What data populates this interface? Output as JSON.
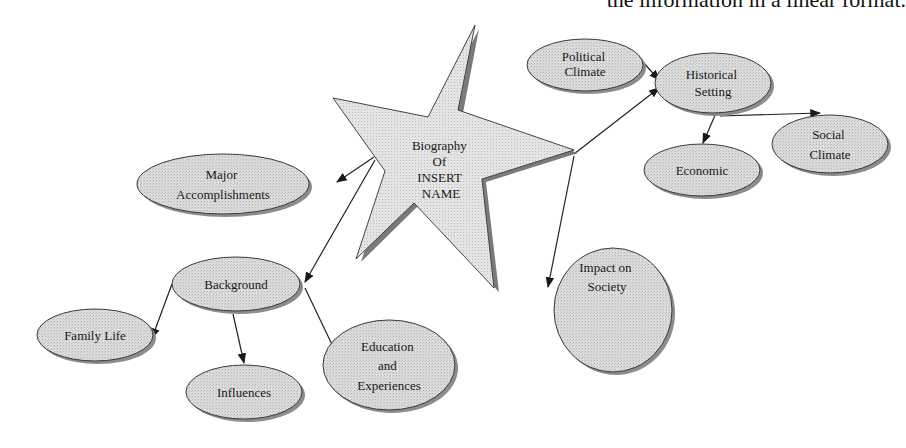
{
  "caption": "the information in a linear format.",
  "diagram": {
    "type": "concept-map",
    "colors": {
      "node_fill": "#d9d9d9",
      "node_stroke": "#3a3a3a",
      "shadow": "#8c8c8c",
      "edge": "#222222",
      "star_fill": "#e0e0e0"
    },
    "center": {
      "id": "biography",
      "shape": "star",
      "lines": [
        "Biography",
        "Of",
        "INSERT",
        "NAME"
      ]
    },
    "nodes": [
      {
        "id": "political-climate",
        "lines": [
          "Political",
          "Climate"
        ]
      },
      {
        "id": "historical-setting",
        "lines": [
          "Historical",
          "Setting"
        ]
      },
      {
        "id": "economic",
        "lines": [
          "Economic"
        ]
      },
      {
        "id": "social-climate",
        "lines": [
          "Social",
          "Climate"
        ]
      },
      {
        "id": "major-accomplishments",
        "lines": [
          "Major",
          "Accomplishments"
        ]
      },
      {
        "id": "background",
        "lines": [
          "Background"
        ]
      },
      {
        "id": "family-life",
        "lines": [
          "Family Life"
        ]
      },
      {
        "id": "influences",
        "lines": [
          "Influences"
        ]
      },
      {
        "id": "education-experiences",
        "lines": [
          "Education",
          "and",
          "Experiences"
        ]
      },
      {
        "id": "impact-on-society",
        "lines": [
          "Impact on",
          "Society"
        ]
      }
    ],
    "edges": [
      {
        "from": "biography",
        "to": "historical-setting"
      },
      {
        "from": "political-climate",
        "to": "historical-setting"
      },
      {
        "from": "historical-setting",
        "to": "economic"
      },
      {
        "from": "historical-setting",
        "to": "social-climate"
      },
      {
        "from": "biography",
        "to": "major-accomplishments"
      },
      {
        "from": "biography",
        "to": "background"
      },
      {
        "from": "biography",
        "to": "impact-on-society"
      },
      {
        "from": "background",
        "to": "family-life"
      },
      {
        "from": "background",
        "to": "influences"
      },
      {
        "from": "background",
        "to": "education-experiences"
      }
    ]
  }
}
